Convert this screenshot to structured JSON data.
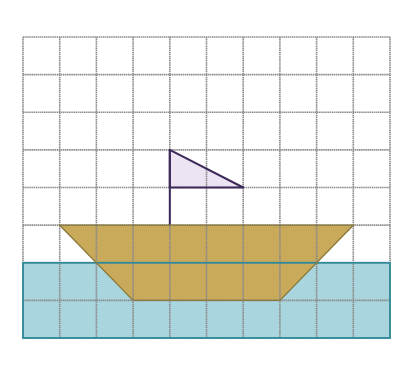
{
  "diagram": {
    "type": "grid-picture",
    "grid": {
      "columns": 10,
      "rows": 8,
      "line_color": "#8a8a8a"
    },
    "water": {
      "fill": "#a9d5de",
      "stroke": "#2e8a9a",
      "from_row": 6,
      "to_row": 8
    },
    "hull": {
      "fill": "#c9a95a",
      "stroke": "#8a7a3a",
      "top_left_col": 1,
      "top_right_col": 9,
      "top_row": 5,
      "bottom_left_col": 3,
      "bottom_right_col": 7,
      "bottom_row": 7
    },
    "mast": {
      "color": "#3d2a5a",
      "col": 4,
      "top_row": 3,
      "bottom_row": 5
    },
    "flag": {
      "fill": "#ece4f2",
      "stroke": "#3d2a5a",
      "points": [
        [
          4,
          3
        ],
        [
          6,
          4
        ],
        [
          4,
          4
        ]
      ]
    }
  }
}
